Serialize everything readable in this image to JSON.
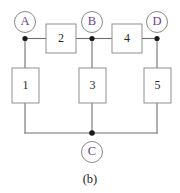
{
  "figure": {
    "caption": "(b)",
    "background_color": "#ffffff",
    "width": 180,
    "height": 193
  },
  "style": {
    "wire_color": "#6f6f6f",
    "node_label_color": "#6a3f8f",
    "node_circle_color": "#8a8a8a",
    "box_border_color": "#8f8f8f",
    "box_label_color": "#2a2a2a",
    "junction_color": "#1a1a1a"
  },
  "nodes": [
    {
      "label": "A",
      "cx": 25,
      "cy": 22,
      "r": 10.5
    },
    {
      "label": "B",
      "cx": 92,
      "cy": 22,
      "r": 10.5
    },
    {
      "label": "D",
      "cx": 157,
      "cy": 22,
      "r": 10.5
    },
    {
      "label": "C",
      "cx": 92,
      "cy": 152,
      "r": 10.5
    }
  ],
  "components": [
    {
      "label": "1",
      "x": 12,
      "y": 68,
      "w": 27,
      "h": 35,
      "orientation": "vertical"
    },
    {
      "label": "2",
      "x": 46,
      "y": 24,
      "w": 30,
      "h": 29,
      "orientation": "horizontal"
    },
    {
      "label": "3",
      "x": 79,
      "y": 68,
      "w": 27,
      "h": 35,
      "orientation": "vertical"
    },
    {
      "label": "4",
      "x": 112,
      "y": 24,
      "w": 30,
      "h": 29,
      "orientation": "horizontal"
    },
    {
      "label": "5",
      "x": 144,
      "y": 68,
      "w": 27,
      "h": 35,
      "orientation": "vertical"
    }
  ],
  "junctions": [
    {
      "name": "junction-a",
      "cx": 25,
      "cy": 38.5,
      "r": 2.6
    },
    {
      "name": "junction-b",
      "cx": 92,
      "cy": 38.5,
      "r": 2.6
    },
    {
      "name": "junction-d",
      "cx": 157,
      "cy": 38.5,
      "r": 2.6
    },
    {
      "name": "junction-c",
      "cx": 92,
      "cy": 133,
      "r": 2.8
    }
  ],
  "wires": [
    {
      "name": "wire-a-to-box2",
      "d": "M 25 38.5 L 46 38.5"
    },
    {
      "name": "wire-box2-to-b",
      "d": "M 76 38.5 L 92 38.5"
    },
    {
      "name": "wire-b-to-box4",
      "d": "M 92 38.5 L 112 38.5"
    },
    {
      "name": "wire-box4-to-d",
      "d": "M 142 38.5 L 157 38.5"
    },
    {
      "name": "wire-a-down-to-box1",
      "d": "M 25 38.5 L 25 68"
    },
    {
      "name": "wire-box1-down-to-bottom",
      "d": "M 25 103 L 25 133"
    },
    {
      "name": "wire-b-down-to-box3",
      "d": "M 92 38.5 L 92 68"
    },
    {
      "name": "wire-box3-down-to-bottom",
      "d": "M 92 103 L 92 133"
    },
    {
      "name": "wire-d-down-to-box5",
      "d": "M 157 38.5 L 157 68"
    },
    {
      "name": "wire-box5-down-to-bottom",
      "d": "M 157 103 L 157 133"
    },
    {
      "name": "wire-bottom-rail-left",
      "d": "M 25 133 L 92 133"
    },
    {
      "name": "wire-bottom-rail-right",
      "d": "M 92 133 L 157 133"
    }
  ],
  "caption_position": {
    "x": 90,
    "y": 180
  }
}
